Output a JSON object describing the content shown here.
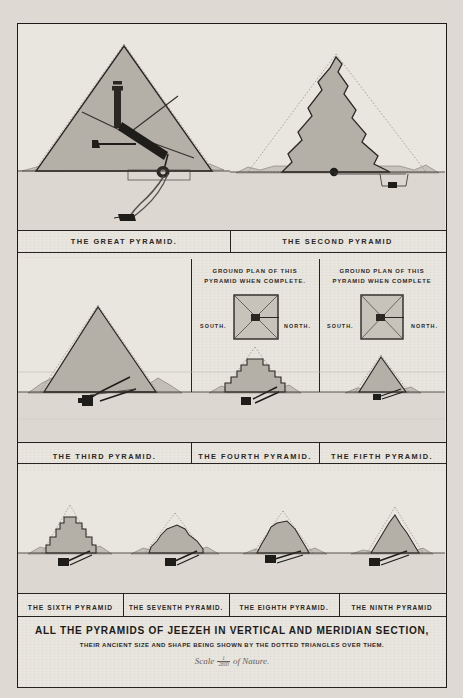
{
  "plate": {
    "main_title": "ALL THE PYRAMIDS OF JEEZEH  IN VERTICAL AND MERIDIAN SECTION,",
    "sub_title": "THEIR ANCIENT SIZE AND SHAPE BEING SHOWN BY THE DOTTED TRIANGLES OVER THEM.",
    "scale_prefix": "Scale",
    "scale_numerator": "1",
    "scale_denominator": "2800",
    "scale_suffix": "of Nature."
  },
  "ground_plan_label": {
    "line1": "GROUND PLAN OF THIS",
    "line2_complete_period": "PYRAMID  WHEN COMPLETE.",
    "line2_complete": "PYRAMID  WHEN COMPLETE",
    "south": "SOUTH.",
    "north": "NORTH."
  },
  "rows": [
    {
      "name": "row-top",
      "panels": [
        {
          "id": "great",
          "caption": "THE GREAT PYRAMID."
        },
        {
          "id": "second",
          "caption": "THE SECOND PYRAMID"
        }
      ]
    },
    {
      "name": "row-middle",
      "panels": [
        {
          "id": "third",
          "caption": "THE THIRD PYRAMID."
        },
        {
          "id": "fourth",
          "caption": "THE FOURTH PYRAMID."
        },
        {
          "id": "fifth",
          "caption": "THE FIFTH PYRAMID."
        }
      ]
    },
    {
      "name": "row-bottom",
      "panels": [
        {
          "id": "sixth",
          "caption": "THE SIXTH PYRAMID"
        },
        {
          "id": "seventh",
          "caption": "THE SEVENTH PYRAMID."
        },
        {
          "id": "eighth",
          "caption": "THE EIGHTH PYRAMID."
        },
        {
          "id": "ninth",
          "caption": "THE NINTH PYRAMID"
        }
      ]
    }
  ],
  "colors": {
    "ink": "#262320",
    "paper": "#e9e6e0",
    "masonry": "#b4b0a8",
    "rubble": "#c3bfb7",
    "ground": "#dcd8d1"
  }
}
